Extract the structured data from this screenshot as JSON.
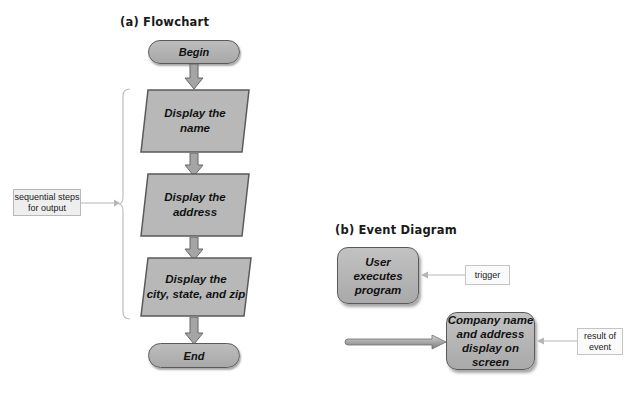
{
  "flowchart": {
    "title": "(a) Flowchart",
    "begin": "Begin",
    "steps": [
      {
        "line1": "Display the",
        "line2": "name"
      },
      {
        "line1": "Display the",
        "line2": "address"
      },
      {
        "line1": "Display the",
        "line2": "city, state, and zip"
      }
    ],
    "end": "End",
    "callout": {
      "line1": "sequential steps",
      "line2": "for output"
    }
  },
  "event_diagram": {
    "title": "(b) Event Diagram",
    "trigger_box": {
      "line1": "User",
      "line2": "executes",
      "line3": "program"
    },
    "trigger_label": "trigger",
    "result_box": {
      "line1": "Company name",
      "line2": "and address",
      "line3": "display on",
      "line4": "screen"
    },
    "result_label": {
      "line1": "result of",
      "line2": "event"
    }
  },
  "colors": {
    "shape_fill": "#b3b3b3",
    "shape_border": "#5a5a5a",
    "arrow_fill": "#a0a0a0",
    "callout_fill": "#eeeeee",
    "connector": "#b5b5b5"
  }
}
